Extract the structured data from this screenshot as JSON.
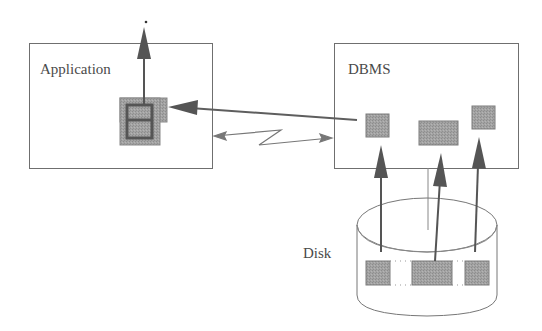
{
  "diagram": {
    "type": "architecture",
    "nodes": [
      {
        "id": "application",
        "label": "Application",
        "shape": "rectangle"
      },
      {
        "id": "dbms",
        "label": "DBMS",
        "shape": "rectangle"
      },
      {
        "id": "disk",
        "label": "Disk",
        "shape": "cylinder"
      }
    ],
    "edges": [
      {
        "from": "dbms-block-1",
        "to": "application-buffer",
        "style": "solid-arrow"
      },
      {
        "from": "application",
        "to": "dbms",
        "style": "bidirectional-lightning"
      },
      {
        "from": "application-buffer",
        "to": "out",
        "style": "solid-arrow"
      },
      {
        "from": "disk-block-1",
        "to": "dbms",
        "style": "solid-arrow"
      },
      {
        "from": "disk-block-2",
        "to": "dbms",
        "style": "solid-arrow"
      },
      {
        "from": "disk-block-3",
        "to": "dbms",
        "style": "solid-arrow"
      }
    ]
  },
  "labels": {
    "application": "Application",
    "dbms": "DBMS",
    "disk": "Disk"
  },
  "colors": {
    "stroke": "#6b6b6b",
    "arrow": "#555555",
    "block_fill": "#9a9a9a",
    "block_border": "#7a7a7a",
    "frame_dark": "#555555"
  }
}
